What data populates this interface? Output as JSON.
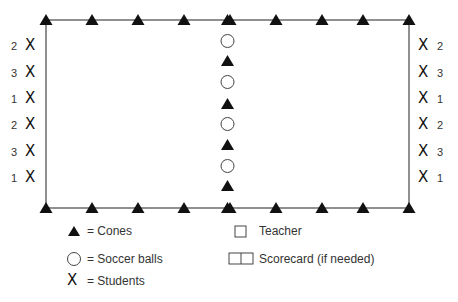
{
  "field": {
    "rect": {
      "left": 46,
      "top": 20,
      "right": 409,
      "bottom": 208
    },
    "line_color": "#555555",
    "cone_color": "#111111",
    "top_cones_x": [
      46,
      92,
      138,
      184,
      230,
      276,
      322,
      363,
      409
    ],
    "bottom_cones_x": [
      46,
      92,
      138,
      184,
      230,
      276,
      322,
      363,
      409
    ],
    "center_column": [
      {
        "type": "cone",
        "y": 20
      },
      {
        "type": "ball",
        "y": 41
      },
      {
        "type": "cone",
        "y": 61
      },
      {
        "type": "ball",
        "y": 82
      },
      {
        "type": "cone",
        "y": 104
      },
      {
        "type": "ball",
        "y": 124
      },
      {
        "type": "cone",
        "y": 145
      },
      {
        "type": "ball",
        "y": 166
      },
      {
        "type": "cone",
        "y": 186
      },
      {
        "type": "cone",
        "y": 208
      }
    ]
  },
  "students": {
    "symbol": "X",
    "left": [
      {
        "number": "2",
        "y": 46
      },
      {
        "number": "3",
        "y": 73
      },
      {
        "number": "1",
        "y": 99
      },
      {
        "number": "2",
        "y": 125
      },
      {
        "number": "3",
        "y": 152
      },
      {
        "number": "1",
        "y": 178
      }
    ],
    "right": [
      {
        "number": "2",
        "y": 46
      },
      {
        "number": "3",
        "y": 73
      },
      {
        "number": "1",
        "y": 99
      },
      {
        "number": "2",
        "y": 125
      },
      {
        "number": "3",
        "y": 152
      },
      {
        "number": "1",
        "y": 178
      }
    ]
  },
  "legend": {
    "cones": "= Cones",
    "balls": "= Soccer balls",
    "students": "= Students",
    "students_symbol": "X",
    "teacher": "Teacher",
    "scorecard": "Scorecard (if needed)"
  }
}
